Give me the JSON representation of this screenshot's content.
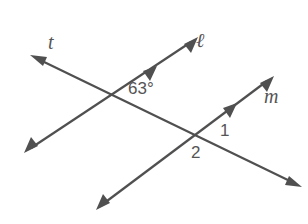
{
  "diagram": {
    "colors": {
      "stroke": "#505050",
      "text": "#555555",
      "background": "#ffffff"
    },
    "lines": [
      {
        "name": "t",
        "role": "transversal",
        "from": [
          32,
          56
        ],
        "to": [
          300,
          186
        ],
        "arrows": "both"
      },
      {
        "name": "ℓ",
        "role": "parallel",
        "from": [
          25,
          152
        ],
        "to": [
          197,
          38
        ],
        "arrows": "both",
        "parallel_mark_at": [
          152,
          69
        ]
      },
      {
        "name": "m",
        "role": "parallel",
        "from": [
          97,
          209
        ],
        "to": [
          273,
          76
        ],
        "arrows": "both",
        "parallel_mark_at": [
          233,
          106
        ]
      }
    ],
    "labels": {
      "t": "t",
      "l": "ℓ",
      "m": "m",
      "angle_given": "63°",
      "angle_1": "1",
      "angle_2": "2"
    }
  }
}
